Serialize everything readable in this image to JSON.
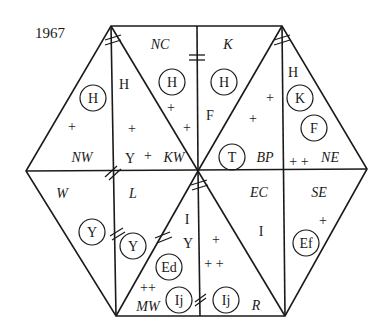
{
  "figure": {
    "year": "1967",
    "regions": [
      {
        "id": "NC",
        "label": "NC",
        "x": 160,
        "y": 49
      },
      {
        "id": "K",
        "label": "K",
        "x": 228,
        "y": 49
      },
      {
        "id": "NW",
        "label": "NW",
        "x": 82,
        "y": 162
      },
      {
        "id": "KW",
        "label": "KW",
        "x": 174,
        "y": 162
      },
      {
        "id": "BP",
        "label": "BP",
        "x": 265,
        "y": 162
      },
      {
        "id": "NE",
        "label": "NE",
        "x": 330,
        "y": 162
      },
      {
        "id": "W",
        "label": "W",
        "x": 62,
        "y": 198
      },
      {
        "id": "L",
        "label": "L",
        "x": 133,
        "y": 198
      },
      {
        "id": "EC",
        "label": "EC",
        "x": 259,
        "y": 197
      },
      {
        "id": "SE",
        "label": "SE",
        "x": 319,
        "y": 197
      },
      {
        "id": "MW",
        "label": "MW",
        "x": 148,
        "y": 311
      },
      {
        "id": "R",
        "label": "R",
        "x": 256,
        "y": 310
      }
    ],
    "plain_symbols": [
      {
        "text": "H",
        "x": 124,
        "y": 89
      },
      {
        "text": "Y",
        "x": 130,
        "y": 163
      },
      {
        "text": "F",
        "x": 210,
        "y": 120
      },
      {
        "text": "H",
        "x": 293,
        "y": 77
      },
      {
        "text": "I",
        "x": 187,
        "y": 224
      },
      {
        "text": "Y",
        "x": 188,
        "y": 248
      },
      {
        "text": "I",
        "x": 261,
        "y": 236
      }
    ],
    "circled_symbols": [
      {
        "text": "H",
        "x": 93,
        "y": 98
      },
      {
        "text": "H",
        "x": 172,
        "y": 82
      },
      {
        "text": "H",
        "x": 224,
        "y": 82
      },
      {
        "text": "T",
        "x": 232,
        "y": 157
      },
      {
        "text": "K",
        "x": 300,
        "y": 98
      },
      {
        "text": "F",
        "x": 314,
        "y": 128
      },
      {
        "text": "Y",
        "x": 92,
        "y": 232
      },
      {
        "text": "Y",
        "x": 133,
        "y": 246
      },
      {
        "text": "Ed",
        "x": 169,
        "y": 267
      },
      {
        "text": "Ij",
        "x": 179,
        "y": 300
      },
      {
        "text": "Ij",
        "x": 226,
        "y": 300
      },
      {
        "text": "Ef",
        "x": 306,
        "y": 243
      }
    ],
    "plus_marks": [
      {
        "text": "+",
        "x": 72,
        "y": 127
      },
      {
        "text": "+",
        "x": 132,
        "y": 129
      },
      {
        "text": "+",
        "x": 171,
        "y": 108
      },
      {
        "text": "+",
        "x": 187,
        "y": 128
      },
      {
        "text": "+",
        "x": 148,
        "y": 157
      },
      {
        "text": "+",
        "x": 270,
        "y": 98
      },
      {
        "text": "+",
        "x": 253,
        "y": 119
      },
      {
        "text": "+ +",
        "x": 299,
        "y": 162
      },
      {
        "text": "+",
        "x": 323,
        "y": 221
      },
      {
        "text": "+",
        "x": 216,
        "y": 240
      },
      {
        "text": "+ +",
        "x": 214,
        "y": 264
      },
      {
        "text": "++",
        "x": 148,
        "y": 290
      }
    ]
  }
}
